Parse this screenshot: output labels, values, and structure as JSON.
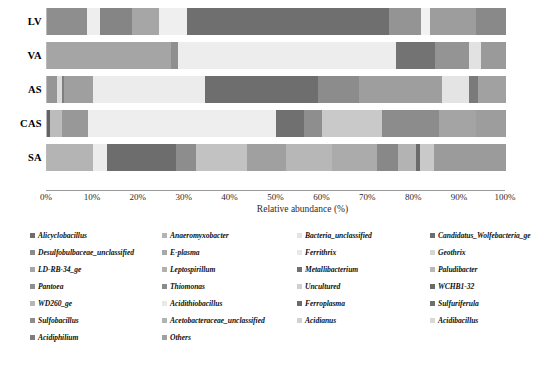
{
  "chart_data": {
    "type": "bar",
    "orientation": "horizontal",
    "stacked": true,
    "title": "",
    "xlabel": "Relative abundance (%)",
    "ylabel": "",
    "xlim": [
      0,
      100
    ],
    "xticks": [
      "0%",
      "10%",
      "20%",
      "30%",
      "40%",
      "50%",
      "60%",
      "70%",
      "80%",
      "90%",
      "100%"
    ],
    "xtick_values": [
      0,
      10,
      20,
      30,
      40,
      50,
      60,
      70,
      80,
      90,
      100
    ],
    "grid": false,
    "legend_position": "below",
    "categories": [
      "LV",
      "VA",
      "AS",
      "CAS",
      "SA"
    ],
    "series": [
      {
        "name": "Alicyclobacillus",
        "color": "#7a7a7a",
        "values": [
          0.0,
          0.0,
          0.0,
          0.4,
          0.0
        ]
      },
      {
        "name": "Anaeromyxobacter",
        "color": "#a9a9a9",
        "values": [
          8.7,
          0.0,
          3.0,
          0.0,
          0.0
        ]
      },
      {
        "name": "Bacteria_unclassified",
        "color": "#ececec",
        "values": [
          2.8,
          0.0,
          0.0,
          0.0,
          0.0
        ]
      },
      {
        "name": "Candidatus_Wolfebacteria_ge",
        "color": "#8d8d8d",
        "values": [
          7.0,
          0.0,
          1.0,
          0.0,
          0.0
        ]
      },
      {
        "name": "Desulfobulbaceae_unclassified",
        "color": "#9e9e9e",
        "values": [
          5.9,
          27.0,
          0.0,
          0.0,
          0.0
        ]
      },
      {
        "name": "E-plasma",
        "color": "#b5b5b5",
        "values": [
          0.0,
          0.0,
          0.5,
          3.0,
          0.0
        ]
      },
      {
        "name": "Ferrithrix",
        "color": "#f2f2f2",
        "values": [
          6.1,
          0.0,
          0.0,
          0.0,
          0.0
        ]
      },
      {
        "name": "Geothrix",
        "color": "#e3e3e3",
        "values": [
          0.0,
          0.0,
          0.0,
          0.0,
          0.0
        ]
      },
      {
        "name": "LD-RB-34_ge",
        "color": "#9c9c9c",
        "values": [
          0.0,
          0.0,
          6.0,
          6.0,
          0.0
        ]
      },
      {
        "name": "Leptospirillum",
        "color": "#c0c0c0",
        "values": [
          0.0,
          0.0,
          0.0,
          0.0,
          10.0
        ]
      },
      {
        "name": "Metallibacterium",
        "color": "#777777",
        "values": [
          0.0,
          0.0,
          0.0,
          0.0,
          0.0
        ]
      },
      {
        "name": "Paludibacter",
        "color": "#b0b0b0",
        "values": [
          0.0,
          0.0,
          0.0,
          0.0,
          0.0
        ]
      },
      {
        "name": "Pantoea",
        "color": "#a3a3a3",
        "values": [
          0.0,
          0.0,
          0.0,
          0.0,
          0.0
        ]
      },
      {
        "name": "Thiomonas",
        "color": "#8a8a8a",
        "values": [
          0.0,
          0.0,
          0.0,
          0.0,
          0.0
        ]
      },
      {
        "name": "Uncultured",
        "color": "#e0e0e0",
        "values": [
          0.0,
          0.0,
          0.0,
          0.0,
          0.0
        ]
      },
      {
        "name": "WCHB1-32",
        "color": "#8f8f8f",
        "values": [
          0.0,
          0.0,
          0.0,
          0.0,
          0.0
        ]
      },
      {
        "name": "WD260_ge",
        "color": "#d5d5d5",
        "values": [
          0.0,
          0.0,
          0.0,
          0.0,
          0.0
        ]
      },
      {
        "name": "Acidithiobacillus",
        "color": "#efefef",
        "values": [
          0.0,
          49.0,
          25.0,
          48.0,
          0.0
        ]
      },
      {
        "name": "Ferroplasma",
        "color": "#6f6f6f",
        "values": [
          44.0,
          8.0,
          22.0,
          6.0,
          15.0
        ]
      },
      {
        "name": "Sulfuriferula",
        "color": "#787878",
        "values": [
          0.0,
          0.0,
          0.0,
          0.0,
          0.0
        ]
      },
      {
        "name": "Sulfobacillus",
        "color": "#8b8b8b",
        "values": [
          7.0,
          7.5,
          9.0,
          0.0,
          12.0
        ]
      },
      {
        "name": "Acetobacteraceae_unclassified",
        "color": "#c7c7c7",
        "values": [
          0.0,
          0.0,
          0.0,
          0.0,
          0.0
        ]
      },
      {
        "name": "Acidianus",
        "color": "#ededed",
        "values": [
          2.0,
          2.5,
          5.5,
          13.0,
          0.0
        ]
      },
      {
        "name": "Acidibacillus",
        "color": "#d9d9d9",
        "values": [
          0.0,
          0.0,
          0.0,
          0.0,
          0.0
        ]
      },
      {
        "name": "Acidiphilium",
        "color": "#9b9b9b",
        "values": [
          0.0,
          0.0,
          0.0,
          0.0,
          0.0
        ]
      },
      {
        "name": "Others",
        "color": "#9f9f9f",
        "values": [
          16.5,
          6.0,
          28.0,
          23.6,
          63.0
        ]
      }
    ],
    "bars": [
      {
        "category": "LV",
        "segments": [
          {
            "taxon": "Anaeromyxobacter",
            "value": 8.7,
            "color": "#8e8e8e"
          },
          {
            "taxon": "Bacteria_unclassified",
            "value": 2.8,
            "color": "#eeeeee"
          },
          {
            "taxon": "Candidatus_Wolfebacteria_ge",
            "value": 7.0,
            "color": "#858585"
          },
          {
            "taxon": "Desulfobulbaceae_unclassified",
            "value": 5.9,
            "color": "#a6a6a6"
          },
          {
            "taxon": "Ferrithrix",
            "value": 6.1,
            "color": "#efefef"
          },
          {
            "taxon": "Ferroplasma",
            "value": 44.0,
            "color": "#6f6f6f"
          },
          {
            "taxon": "Sulfobacillus",
            "value": 7.0,
            "color": "#949494"
          },
          {
            "taxon": "Acidianus",
            "value": 2.0,
            "color": "#f2f2f2"
          },
          {
            "taxon": "Others",
            "value": 10.0,
            "color": "#9d9d9d"
          },
          {
            "taxon": "Acidiphilium",
            "value": 6.5,
            "color": "#898989"
          }
        ]
      },
      {
        "category": "VA",
        "segments": [
          {
            "taxon": "Desulfobulbaceae_unclassified",
            "value": 27.0,
            "color": "#a5a5a5"
          },
          {
            "taxon": "Thiomonas",
            "value": 1.5,
            "color": "#8f8f8f"
          },
          {
            "taxon": "Acidithiobacillus",
            "value": 47.5,
            "color": "#ededed"
          },
          {
            "taxon": "Ferroplasma",
            "value": 8.5,
            "color": "#737373"
          },
          {
            "taxon": "Sulfobacillus",
            "value": 7.5,
            "color": "#949494"
          },
          {
            "taxon": "Acidianus",
            "value": 2.5,
            "color": "#e2e2e2"
          },
          {
            "taxon": "Others",
            "value": 5.5,
            "color": "#9a9a9a"
          }
        ]
      },
      {
        "category": "AS",
        "segments": [
          {
            "taxon": "Anaeromyxobacter",
            "value": 2.2,
            "color": "#969696"
          },
          {
            "taxon": "Bacteria_unclassified",
            "value": 1.0,
            "color": "#dcdcdc"
          },
          {
            "taxon": "Candidatus_Wolfebacteria_ge",
            "value": 0.6,
            "color": "#7e7e7e"
          },
          {
            "taxon": "LD-RB-34_ge",
            "value": 6.2,
            "color": "#9f9f9f"
          },
          {
            "taxon": "Acidithiobacillus",
            "value": 24.5,
            "color": "#ececec"
          },
          {
            "taxon": "Ferroplasma",
            "value": 24.5,
            "color": "#6e6e6e"
          },
          {
            "taxon": "Sulfobacillus",
            "value": 9.0,
            "color": "#8c8c8c"
          },
          {
            "taxon": "Others",
            "value": 18.0,
            "color": "#9e9e9e"
          },
          {
            "taxon": "Acidianus",
            "value": 6.0,
            "color": "#e4e4e4"
          },
          {
            "taxon": "Acidiphilium",
            "value": 2.0,
            "color": "#7a7a7a"
          },
          {
            "taxon": "Acidibacillus",
            "value": 6.0,
            "color": "#a1a1a1"
          }
        ]
      },
      {
        "category": "CAS",
        "segments": [
          {
            "taxon": "Alicyclobacillus",
            "value": 0.6,
            "color": "#636363"
          },
          {
            "taxon": "E-plasma",
            "value": 2.7,
            "color": "#bcbcbc"
          },
          {
            "taxon": "LD-RB-34_ge",
            "value": 5.7,
            "color": "#989898"
          },
          {
            "taxon": "Acidithiobacillus",
            "value": 41.0,
            "color": "#eeeeee"
          },
          {
            "taxon": "Ferroplasma",
            "value": 6.0,
            "color": "#707070"
          },
          {
            "taxon": "Thiomonas",
            "value": 4.0,
            "color": "#8e8e8e"
          },
          {
            "taxon": "Acidianus",
            "value": 13.0,
            "color": "#c9c9c9"
          },
          {
            "taxon": "Others",
            "value": 12.5,
            "color": "#8c8c8c"
          },
          {
            "taxon": "Acidiphilium",
            "value": 8.0,
            "color": "#a4a4a4"
          },
          {
            "taxon": "Paludibacter",
            "value": 6.5,
            "color": "#9d9d9d"
          }
        ]
      },
      {
        "category": "SA",
        "segments": [
          {
            "taxon": "Leptospirillum",
            "value": 10.0,
            "color": "#b4b4b4"
          },
          {
            "taxon": "Bacteria_unclassified",
            "value": 3.0,
            "color": "#ececec"
          },
          {
            "taxon": "Ferroplasma",
            "value": 15.0,
            "color": "#6d6d6d"
          },
          {
            "taxon": "Sulfobacillus",
            "value": 4.5,
            "color": "#8d8d8d"
          },
          {
            "taxon": "Acidianus",
            "value": 11.0,
            "color": "#c2c2c2"
          },
          {
            "taxon": "Others",
            "value": 8.5,
            "color": "#a0a0a0"
          },
          {
            "taxon": "Metallibacterium",
            "value": 10.0,
            "color": "#b7b7b7"
          },
          {
            "taxon": "WD260_ge",
            "value": 10.0,
            "color": "#ababab"
          },
          {
            "taxon": "Sulfuriferula",
            "value": 4.5,
            "color": "#888888"
          },
          {
            "taxon": "Pantoea",
            "value": 4.0,
            "color": "#b3b3b3"
          },
          {
            "taxon": "Geothrix",
            "value": 0.8,
            "color": "#6b6b6b"
          },
          {
            "taxon": "Acidibacillus",
            "value": 3.0,
            "color": "#c9c9c9"
          },
          {
            "taxon": "WCHB1-32",
            "value": 15.7,
            "color": "#9b9b9b"
          }
        ]
      }
    ]
  },
  "axis": {
    "x_title": "Relative abundance (%)"
  },
  "legend": {
    "columns": 4,
    "items": [
      {
        "label": "Alicyclobacillus",
        "color": "#6e6e6e"
      },
      {
        "label": "Anaeromyxobacter",
        "color": "#b4b4b4"
      },
      {
        "label": "Bacteria_unclassified",
        "color": "#e4e4e4"
      },
      {
        "label": "Candidatus_Wolfebacteria_ge",
        "color": "#6d6d6d"
      },
      {
        "label": "Desulfobulbaceae_unclassified",
        "color": "#8b8b8b"
      },
      {
        "label": "E-plasma",
        "color": "#a8a8a8"
      },
      {
        "label": "Ferrithrix",
        "color": "#e8e8e8"
      },
      {
        "label": "Geothrix",
        "color": "#d6d6d6"
      },
      {
        "label": "LD-RB-34_ge",
        "color": "#a6a6a6"
      },
      {
        "label": "Leptospirillum",
        "color": "#b0b0b0"
      },
      {
        "label": "Metallibacterium",
        "color": "#707070"
      },
      {
        "label": "Paludibacter",
        "color": "#b8b8b8"
      },
      {
        "label": "Pantoea",
        "color": "#8f8f8f"
      },
      {
        "label": "Thiomonas",
        "color": "#8a8a8a"
      },
      {
        "label": "Uncultured",
        "color": "#cfcfcf"
      },
      {
        "label": "WCHB1-32",
        "color": "#6a6a6a"
      },
      {
        "label": "WD260_ge",
        "color": "#b6b6b6"
      },
      {
        "label": "Acidithiobacillus",
        "color": "#e9e9e9"
      },
      {
        "label": "Ferroplasma",
        "color": "#6b6b6b"
      },
      {
        "label": "Sulfuriferula",
        "color": "#6f6f6f"
      },
      {
        "label": "Sulfobacillus",
        "color": "#8d8d8d"
      },
      {
        "label": "Acetobacteraceae_unclassified",
        "color": "#b2b2b2"
      },
      {
        "label": "Acidianus",
        "color": "#d2d2d2"
      },
      {
        "label": "Acidibacillus",
        "color": "#d8d8d8"
      },
      {
        "label": "Acidiphilium",
        "color": "#7e7e7e"
      },
      {
        "label": "Others",
        "color": "#a0a0a0"
      }
    ]
  }
}
